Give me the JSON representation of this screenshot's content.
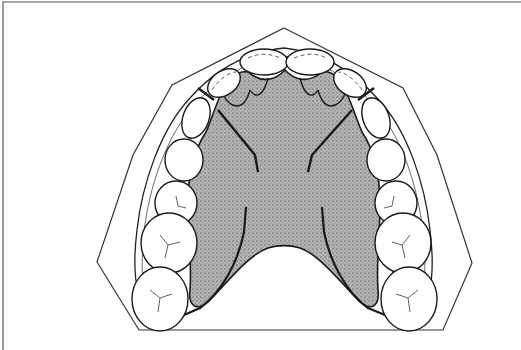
{
  "figure": {
    "colors": {
      "line": "#1a1a1a",
      "palate_fill": "#a9a9a9",
      "palate_stipple": "#6f6f6f",
      "background": "#ffffff",
      "frame": "#9a9a9a"
    }
  }
}
